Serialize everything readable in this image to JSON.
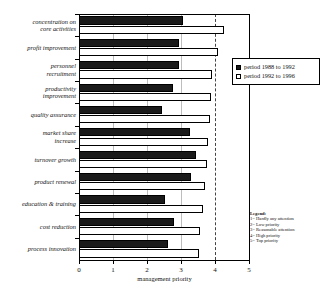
{
  "chart_data": {
    "type": "bar",
    "orientation": "horizontal",
    "title": "",
    "xlabel": "management priority",
    "ylabel": "",
    "xlim": [
      0,
      5
    ],
    "xticks": [
      0,
      1,
      2,
      3,
      4,
      5
    ],
    "xticklabels": [
      "0",
      "1",
      "2",
      "3",
      "4",
      "5"
    ],
    "grid": true,
    "grid_axis": "x",
    "dashed_reference_line": 4,
    "legend_position": "upper right",
    "categories": [
      "concentration on\ncore activities",
      "profit improvement",
      "personnel\nrecruitment",
      "productivity\nimprovement",
      "quality assurance",
      "market share\nincrease",
      "turnover growth",
      "product renewal",
      "education & training",
      "cost reduction",
      "process innovation"
    ],
    "series": [
      {
        "name": "period 1988 to 1992",
        "color": "#1a1a1a",
        "values": [
          3.05,
          2.95,
          2.95,
          2.75,
          2.45,
          3.25,
          3.45,
          3.28,
          2.52,
          2.8,
          2.62
        ]
      },
      {
        "name": "period 1992 to 1996",
        "color": "#ffffff",
        "values": [
          4.25,
          4.08,
          3.92,
          3.88,
          3.85,
          3.78,
          3.75,
          3.7,
          3.65,
          3.55,
          3.52
        ]
      }
    ]
  },
  "legend": {
    "entries": [
      {
        "label": "period 1988 to 1992",
        "swatch": "dark"
      },
      {
        "label": "period 1992 to 1996",
        "swatch": "light"
      }
    ]
  },
  "scale_legend": {
    "title": "Legend:",
    "items": [
      "1= Hardly any attention",
      "2= Low priority",
      "3= Reasonable attention",
      "4= High priority",
      "5= Top priority"
    ]
  },
  "axis": {
    "x_title": "management priority"
  }
}
